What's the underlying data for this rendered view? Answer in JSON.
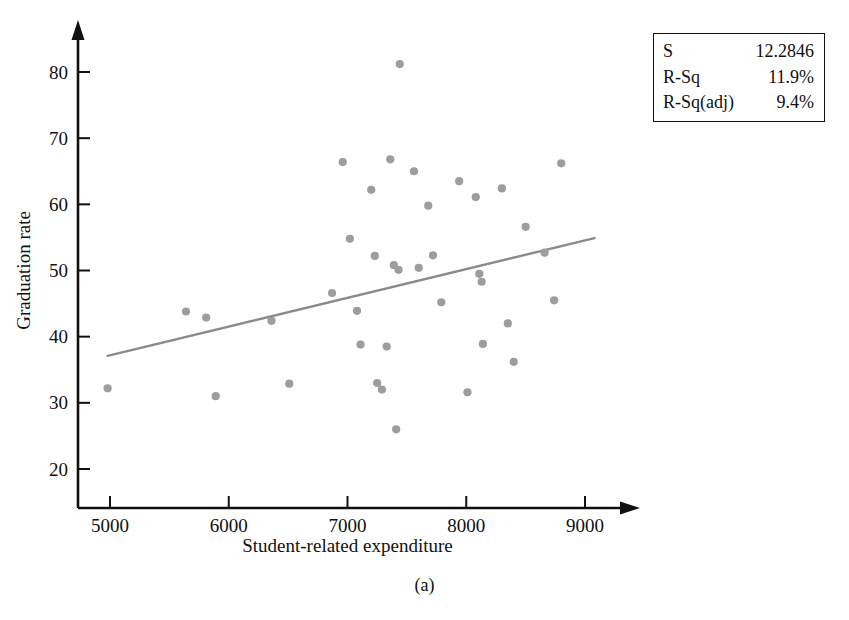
{
  "caption": "(a)",
  "legend": {
    "rows": [
      {
        "label": "S",
        "value": "12.2846"
      },
      {
        "label": "R-Sq",
        "value": "11.9%"
      },
      {
        "label": "R-Sq(adj)",
        "value": "9.4%"
      }
    ]
  },
  "colors": {
    "marker": "#9d9d9d",
    "regression_line": "#8a8a8a",
    "axis": "#111111",
    "background": "#ffffff"
  },
  "chart_data": {
    "type": "scatter",
    "title": "",
    "xlabel": "Student-related expenditure",
    "ylabel": "Graduation rate",
    "xlim": [
      4600,
      9250
    ],
    "ylim": [
      15,
      84
    ],
    "xticks": [
      5000,
      6000,
      7000,
      8000,
      9000
    ],
    "yticks": [
      20,
      30,
      40,
      50,
      60,
      70,
      80
    ],
    "grid": false,
    "legend_position": "top-right",
    "points": [
      {
        "x": 4980,
        "y": 32.2
      },
      {
        "x": 5640,
        "y": 43.8
      },
      {
        "x": 5810,
        "y": 42.9
      },
      {
        "x": 5890,
        "y": 31.0
      },
      {
        "x": 6360,
        "y": 42.4
      },
      {
        "x": 6510,
        "y": 32.9
      },
      {
        "x": 6870,
        "y": 46.6
      },
      {
        "x": 6960,
        "y": 66.4
      },
      {
        "x": 7020,
        "y": 54.8
      },
      {
        "x": 7080,
        "y": 43.9
      },
      {
        "x": 7110,
        "y": 38.8
      },
      {
        "x": 7200,
        "y": 62.2
      },
      {
        "x": 7230,
        "y": 52.2
      },
      {
        "x": 7250,
        "y": 33.0
      },
      {
        "x": 7290,
        "y": 32.0
      },
      {
        "x": 7330,
        "y": 38.5
      },
      {
        "x": 7360,
        "y": 66.8
      },
      {
        "x": 7390,
        "y": 50.8
      },
      {
        "x": 7410,
        "y": 26.0
      },
      {
        "x": 7430,
        "y": 50.1
      },
      {
        "x": 7440,
        "y": 81.2
      },
      {
        "x": 7560,
        "y": 65.0
      },
      {
        "x": 7600,
        "y": 50.4
      },
      {
        "x": 7680,
        "y": 59.8
      },
      {
        "x": 7720,
        "y": 52.3
      },
      {
        "x": 7790,
        "y": 45.2
      },
      {
        "x": 7940,
        "y": 63.5
      },
      {
        "x": 8010,
        "y": 31.6
      },
      {
        "x": 8080,
        "y": 61.1
      },
      {
        "x": 8110,
        "y": 49.5
      },
      {
        "x": 8130,
        "y": 48.3
      },
      {
        "x": 8140,
        "y": 38.9
      },
      {
        "x": 8300,
        "y": 62.4
      },
      {
        "x": 8350,
        "y": 42.0
      },
      {
        "x": 8400,
        "y": 36.2
      },
      {
        "x": 8500,
        "y": 56.6
      },
      {
        "x": 8660,
        "y": 52.7
      },
      {
        "x": 8740,
        "y": 45.5
      },
      {
        "x": 8800,
        "y": 66.2
      }
    ],
    "regression_line": {
      "x_start": 4980,
      "y_start": 37.1,
      "x_end": 9080,
      "y_end": 54.9
    }
  }
}
